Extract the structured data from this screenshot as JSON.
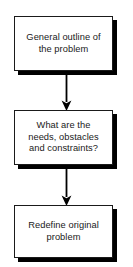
{
  "diagram": {
    "type": "flowchart",
    "orientation": "vertical-top-to-bottom",
    "background_color": "#ffffff",
    "node_fill_color": "#ffffff",
    "node_border_color": "#1a1a1a",
    "node_shadow_color": "#000000",
    "text_color": "#1a1a1a",
    "connector_color": "#000000",
    "nodes": [
      {
        "id": "general-outline",
        "label": "General outline of\nthe problem",
        "shape": "rectangle"
      },
      {
        "id": "needs-obstacles-constraints",
        "label": "What are the\nneeds, obstacles\nand constraints?",
        "shape": "rectangle"
      },
      {
        "id": "redefine-original-problem",
        "label": "Redefine original\nproblem",
        "shape": "rectangle"
      }
    ],
    "connectors": [
      {
        "id": "arrow-1",
        "from": "general-outline",
        "to": "needs-obstacles-constraints",
        "arrowhead": "solid-triangle-down"
      },
      {
        "id": "arrow-2",
        "from": "needs-obstacles-constraints",
        "to": "redefine-original-problem",
        "arrowhead": "solid-triangle-down"
      }
    ]
  }
}
